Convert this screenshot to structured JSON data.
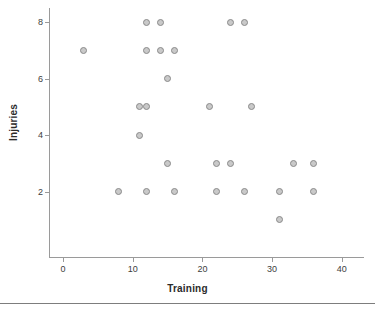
{
  "chart_data": {
    "type": "scatter",
    "title": "",
    "xlabel": "Training",
    "ylabel": "Injuries",
    "xlim": [
      -2,
      43
    ],
    "ylim": [
      0.3,
      8.7
    ],
    "xticks": [
      0,
      10,
      20,
      30,
      40
    ],
    "yticks": [
      2,
      4,
      6,
      8
    ],
    "xtick_labels": [
      "0",
      "10",
      "20",
      "30",
      "40"
    ],
    "ytick_labels": [
      "2",
      "4",
      "6",
      "8"
    ],
    "grid": false,
    "legend": null,
    "marker": {
      "shape": "circle",
      "fill_color": "#c9c9c9",
      "edge_color": "#8a8a8a",
      "size_px": 7
    },
    "axis_color": "#9a9a9a",
    "points": [
      {
        "x": 12,
        "y": 8
      },
      {
        "x": 14,
        "y": 8
      },
      {
        "x": 24,
        "y": 8
      },
      {
        "x": 26,
        "y": 8
      },
      {
        "x": 3,
        "y": 7
      },
      {
        "x": 12,
        "y": 7
      },
      {
        "x": 14,
        "y": 7
      },
      {
        "x": 16,
        "y": 7
      },
      {
        "x": 15,
        "y": 6
      },
      {
        "x": 11,
        "y": 5
      },
      {
        "x": 12,
        "y": 5
      },
      {
        "x": 21,
        "y": 5
      },
      {
        "x": 27,
        "y": 5
      },
      {
        "x": 11,
        "y": 4
      },
      {
        "x": 15,
        "y": 3
      },
      {
        "x": 22,
        "y": 3
      },
      {
        "x": 24,
        "y": 3
      },
      {
        "x": 33,
        "y": 3
      },
      {
        "x": 36,
        "y": 3
      },
      {
        "x": 8,
        "y": 2
      },
      {
        "x": 12,
        "y": 2
      },
      {
        "x": 16,
        "y": 2
      },
      {
        "x": 22,
        "y": 2
      },
      {
        "x": 26,
        "y": 2
      },
      {
        "x": 31,
        "y": 2
      },
      {
        "x": 36,
        "y": 2
      },
      {
        "x": 31,
        "y": 1
      }
    ]
  }
}
